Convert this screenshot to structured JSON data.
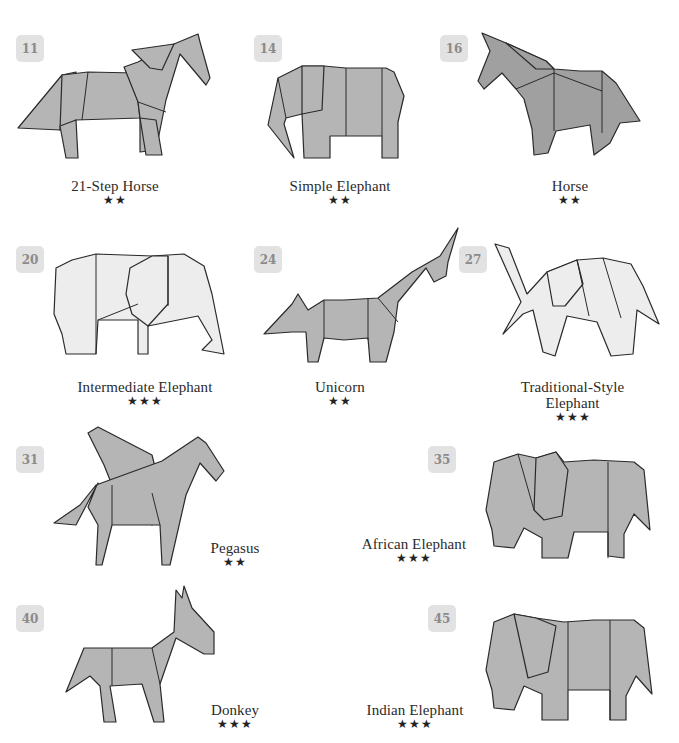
{
  "models": [
    {
      "number": "11",
      "name": "21-Step Horse",
      "difficulty": "★★",
      "stars": 2,
      "icon": "origami-horse-icon"
    },
    {
      "number": "14",
      "name": "Simple Elephant",
      "difficulty": "★★",
      "stars": 2,
      "icon": "origami-elephant-icon"
    },
    {
      "number": "16",
      "name": "Horse",
      "difficulty": "★★",
      "stars": 2,
      "icon": "origami-horse-icon"
    },
    {
      "number": "20",
      "name": "Intermediate Elephant",
      "difficulty": "★★★",
      "stars": 3,
      "icon": "origami-elephant-icon"
    },
    {
      "number": "24",
      "name": "Unicorn",
      "difficulty": "★★",
      "stars": 2,
      "icon": "origami-unicorn-icon"
    },
    {
      "number": "27",
      "name_line1": "Traditional-Style",
      "name_line2": "Elephant",
      "name": "Traditional-Style Elephant",
      "difficulty": "★★★",
      "stars": 3,
      "icon": "origami-elephant-icon"
    },
    {
      "number": "31",
      "name": "Pegasus",
      "difficulty": "★★",
      "stars": 2,
      "icon": "origami-pegasus-icon"
    },
    {
      "number": "35",
      "name": "African Elephant",
      "difficulty": "★★★",
      "stars": 3,
      "icon": "origami-elephant-icon"
    },
    {
      "number": "40",
      "name": "Donkey",
      "difficulty": "★★★",
      "stars": 3,
      "icon": "origami-donkey-icon"
    },
    {
      "number": "45",
      "name": "Indian Elephant",
      "difficulty": "★★★",
      "stars": 3,
      "icon": "origami-elephant-icon"
    }
  ],
  "colors": {
    "badge_bg": "#e2e2e2",
    "badge_text": "#8b8b8b",
    "paper_gray": "#b5b5b5",
    "paper_dark": "#a0a0a0",
    "paper_light": "#ededed"
  }
}
